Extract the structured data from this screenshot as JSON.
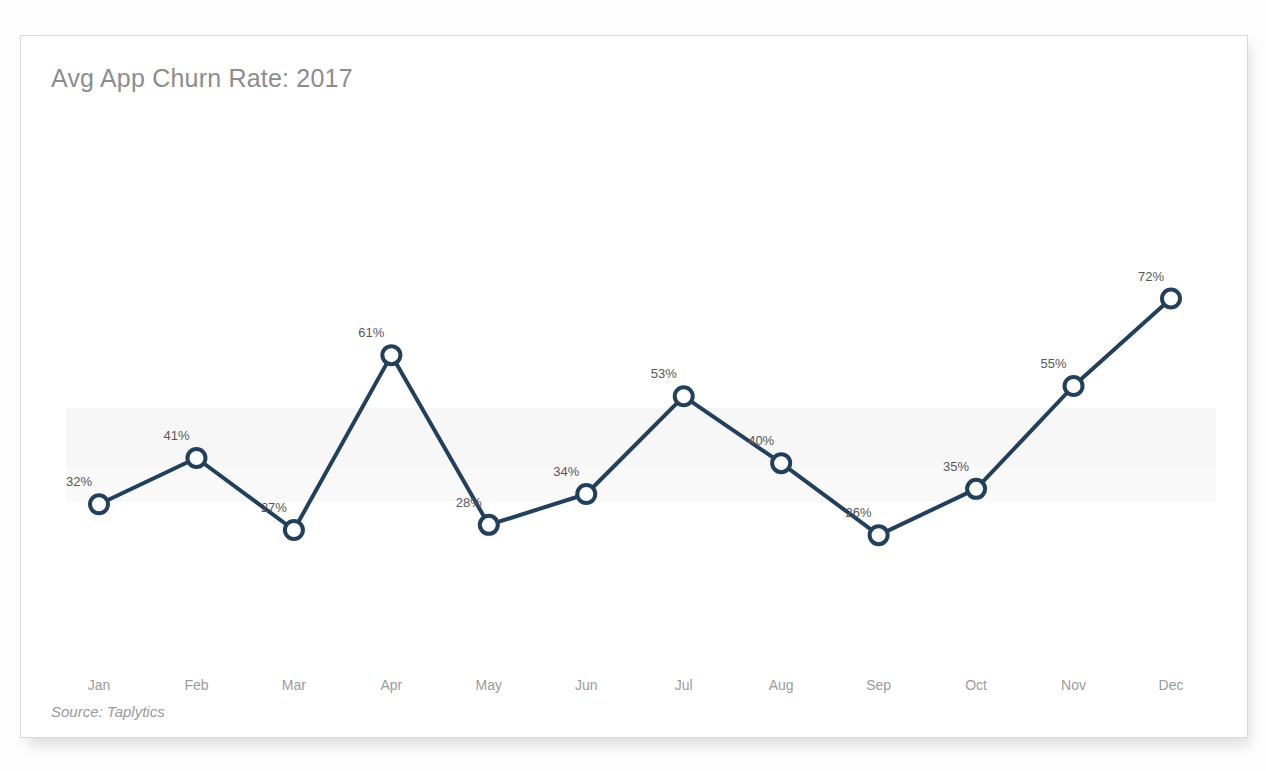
{
  "card": {
    "title": "Avg App Churn Rate: 2017",
    "source": "Source: Taplytics"
  },
  "colors": {
    "line": "#22405c",
    "marker_fill": "#ffffff",
    "title_text": "#8d8d8d",
    "value_label": "#585858",
    "tick_label": "#9b9b9b",
    "card_background": "#ffffff",
    "card_border": "#d8d8d8",
    "page_background": "#fdfdfd"
  },
  "chart_data": {
    "type": "line",
    "title": "Avg App Churn Rate: 2017",
    "subtitle": "",
    "xlabel": "",
    "ylabel": "",
    "categories": [
      "Jan",
      "Feb",
      "Mar",
      "Apr",
      "May",
      "Jun",
      "Jul",
      "Aug",
      "Sep",
      "Oct",
      "Nov",
      "Dec"
    ],
    "values": [
      32,
      41,
      27,
      61,
      28,
      34,
      53,
      40,
      26,
      35,
      55,
      72
    ],
    "value_labels": [
      "32%",
      "41%",
      "27%",
      "61%",
      "28%",
      "34%",
      "53%",
      "40%",
      "26%",
      "35%",
      "55%",
      "72%"
    ],
    "series": [
      {
        "name": "Avg App Churn Rate",
        "values": [
          32,
          41,
          27,
          61,
          28,
          34,
          53,
          40,
          26,
          35,
          55,
          72
        ]
      }
    ],
    "unit": "%",
    "ylim": [
      20,
      76
    ],
    "grid": false,
    "legend": false,
    "legend_position": "none",
    "markers": "open-circle",
    "annotations": [
      "Source: Taplytics"
    ]
  }
}
